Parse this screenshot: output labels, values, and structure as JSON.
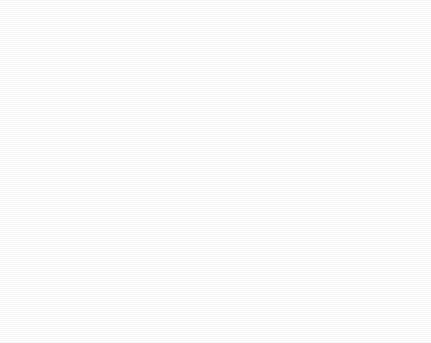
{
  "chart_data": {
    "type": "pie",
    "title": "",
    "subtitle": "",
    "xlabel": "",
    "ylabel": "",
    "legend_position": "none",
    "grid": false,
    "units": "percent",
    "start_angle_deg": 0,
    "direction": "clockwise",
    "categories": [
      "Afghanistan",
      "Algeria",
      "China",
      "Iraq",
      "Jordan",
      "Kuwait",
      "Libya",
      "Morocco",
      "Other",
      "Pakistan",
      "Russia",
      "Saudi Arabia",
      "Sudan",
      "Syria",
      "Tajikistan",
      "Tunisia",
      "United Kingdom",
      "Yemen"
    ],
    "values": [
      28.1,
      3.2,
      2.8,
      1.2,
      1.0,
      1.5,
      1.7,
      1.9,
      9.7,
      9.0,
      1.2,
      18.0,
      1.5,
      1.2,
      1.5,
      1.5,
      1.0,
      14.0
    ],
    "slices": [
      {
        "name": "Afghanistan",
        "value": 28.1,
        "label": "Afghanistan, 28.10%",
        "label_line1": "Afghanistan,",
        "label_line2": "28.10%",
        "color": "#4a4a4a",
        "label_placement": "inside",
        "label_color": "light"
      },
      {
        "name": "Algeria",
        "value": 3.2,
        "label": "Algeria, 3.20%",
        "label_line1": "Algeria,",
        "label_line2": "3.20%",
        "color": "#9a9a9a",
        "label_placement": "outside",
        "label_color": "dark"
      },
      {
        "name": "China",
        "value": 2.8,
        "label": "China, 2.80%",
        "label_line1": "China, 2.80%",
        "label_line2": "",
        "color": "#5e5e5e",
        "label_placement": "outside",
        "label_color": "dark"
      },
      {
        "name": "Iraq",
        "value": 1.2,
        "label": "Iraq, 1.20%",
        "label_line1": "Iraq, 1.20%",
        "label_line2": "",
        "color": "#a6a6a6",
        "label_placement": "outside",
        "label_color": "dark"
      },
      {
        "name": "Jordan",
        "value": 1.0,
        "label": "Jordan, 1.00%",
        "label_line1": "Jordan, 1.00%",
        "label_line2": "",
        "color": "#5a5a5a",
        "label_placement": "outside",
        "label_color": "dark"
      },
      {
        "name": "Kuwait",
        "value": 1.5,
        "label": "Kuwait, 1.50%",
        "label_line1": "Kuwait,",
        "label_line2": "1.50%",
        "color": "#8f8f8f",
        "label_placement": "outside",
        "label_color": "dark"
      },
      {
        "name": "Libya",
        "value": 1.7,
        "label": "Libya, 1.70%",
        "label_line1": "Libya, 1.70%",
        "label_line2": "",
        "color": "#4f4f4f",
        "label_placement": "outside",
        "label_color": "dark"
      },
      {
        "name": "Morocco",
        "value": 1.9,
        "label": "Morocco, 1.90%",
        "label_line1": "Morocco, 1.90%",
        "label_line2": "",
        "color": "#737373",
        "label_placement": "outside",
        "label_color": "dark"
      },
      {
        "name": "Other",
        "value": 9.7,
        "label": "Other, 9.70%",
        "label_line1": "Other, 9.70%",
        "label_line2": "",
        "color": "#9d9d9d",
        "label_placement": "inside",
        "label_color": "light"
      },
      {
        "name": "Pakistan",
        "value": 9.0,
        "label": "Pakistan, 9.00%",
        "label_line1": "Pakistan,",
        "label_line2": "9.00%",
        "color": "#555555",
        "label_placement": "inside",
        "label_color": "light"
      },
      {
        "name": "Russia",
        "value": 1.2,
        "label": "Russia, 1.20%",
        "label_line1": "Russia, 1.20%",
        "label_line2": "",
        "color": "#868686",
        "label_placement": "outside",
        "label_color": "dark"
      },
      {
        "name": "Saudi Arabia",
        "value": 18.0,
        "label": "Saudi Arabia, 18.00%",
        "label_line1": "Saudi Arabia,",
        "label_line2": "18.00%",
        "color": "#8b8b8b",
        "label_placement": "inside",
        "label_color": "dark"
      },
      {
        "name": "Sudan",
        "value": 1.5,
        "label": "Sudan, 1.50%",
        "label_line1": "Sudan,",
        "label_line2": "1.50%",
        "color": "#6f6f6f",
        "label_placement": "outside",
        "label_color": "dark"
      },
      {
        "name": "Syria",
        "value": 1.2,
        "label": "Syria, 1.20%",
        "label_line1": "Syria, 1.20%",
        "label_line2": "",
        "color": "#9e9e9e",
        "label_placement": "outside",
        "label_color": "dark"
      },
      {
        "name": "Tajikistan",
        "value": 1.5,
        "label": "Tajikistan, 1.50%",
        "label_line1": "Tajikistan,",
        "label_line2": "1.50%",
        "color": "#616161",
        "label_placement": "outside",
        "label_color": "dark"
      },
      {
        "name": "Tunisia",
        "value": 1.5,
        "label": "Tunisia, 1.50%",
        "label_line1": "Tunisia, 1.50%",
        "label_line2": "",
        "color": "#a2a2a2",
        "label_placement": "outside",
        "label_color": "dark"
      },
      {
        "name": "United Kingdom",
        "value": 1.0,
        "label": "United Kingdom, 1.00%",
        "label_line1": "United Kingdom,",
        "label_line2": "1.00%",
        "color": "#5c5c5c",
        "label_placement": "outside",
        "label_color": "dark"
      },
      {
        "name": "Yemen",
        "value": 14.0,
        "label": "Yemen, 14.00%",
        "label_line1": "Yemen, 14.00%",
        "label_line2": "",
        "color": "#939393",
        "label_placement": "inside",
        "label_color": "dark"
      }
    ]
  },
  "geometry": {
    "center_x": 209,
    "center_y": 165,
    "radius": 146
  },
  "colors": {
    "background": "#ffffff",
    "label_dark": "#1a1a1a",
    "label_light": "#e8e8e8",
    "leader_line": "#2a2a2a"
  }
}
